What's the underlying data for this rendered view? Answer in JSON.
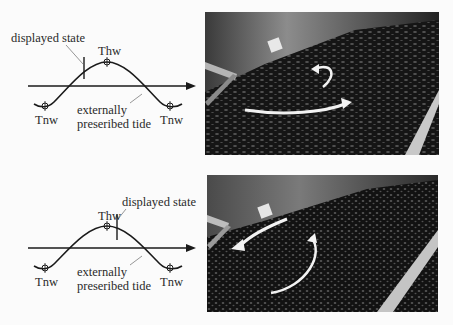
{
  "panels": [
    {
      "diagram": {
        "labels": {
          "displayed_state": "displayed state",
          "high_water": "Thw",
          "low_water_left": "Tnw",
          "low_water_right": "Tnw",
          "tide_line1": "externally",
          "tide_line2": "preseribed tide"
        },
        "marker_phase": "rising, before high water"
      },
      "photo": {
        "description": "Tidal basin model with floating particles; small clockwise eddy arrow and long rightward flow arrow",
        "arrows": [
          "eddy-curl",
          "flow-right"
        ]
      }
    },
    {
      "diagram": {
        "labels": {
          "displayed_state": "displayed state",
          "high_water": "Thw",
          "low_water_left": "Tnw",
          "low_water_right": "Tnw",
          "tide_line1": "externally",
          "tide_line2": "preseribed tide"
        },
        "marker_phase": "falling, just after high water"
      },
      "photo": {
        "description": "Tidal basin model with floating particles; leftward flow arrow and large curved eddy arrow",
        "arrows": [
          "flow-left",
          "eddy-arc"
        ]
      }
    }
  ],
  "colors": {
    "line": "#1a1a1a",
    "leader": "#8a8a8a",
    "photo_dark": "#141414",
    "arrow": "#f2f2f2"
  }
}
